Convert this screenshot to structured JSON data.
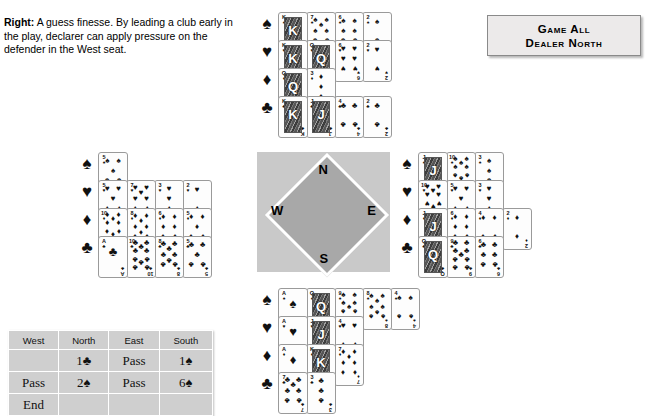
{
  "caption": {
    "lead": "Right:",
    "text": " A guess finesse. By leading a club early in the play, declarer can apply pressure on the defender in the West seat."
  },
  "vulnerability_box": {
    "line1": "Game All",
    "line2": "Dealer North"
  },
  "compass": {
    "north": "N",
    "south": "S",
    "west": "W",
    "east": "E"
  },
  "suits": {
    "spade": "♠",
    "heart": "♥",
    "diamond": "♦",
    "club": "♣"
  },
  "hands": {
    "north": {
      "label": "North",
      "spades": [
        "K",
        "7",
        "6",
        "2"
      ],
      "hearts": [
        "K",
        "Q",
        "6",
        "2"
      ],
      "diamonds": [
        "Q",
        "3"
      ],
      "clubs": [
        "K",
        "J",
        "4",
        "2"
      ]
    },
    "west": {
      "label": "West",
      "spades": [
        "5"
      ],
      "hearts": [
        "5",
        "7",
        "3",
        "2"
      ],
      "diamonds": [
        "10",
        "8",
        "6",
        "5"
      ],
      "clubs": [
        "A",
        "10",
        "8",
        "5"
      ]
    },
    "east": {
      "label": "East",
      "spades": [
        "J",
        "10",
        "3"
      ],
      "hearts": [
        "10",
        "5",
        "3"
      ],
      "diamonds": [
        "J",
        "6",
        "4",
        "2"
      ],
      "clubs": [
        "Q",
        "9",
        "6"
      ]
    },
    "south": {
      "label": "South",
      "spades": [
        "A",
        "Q",
        "9",
        "8",
        "4"
      ],
      "hearts": [
        "A",
        "J",
        "4"
      ],
      "diamonds": [
        "A",
        "K",
        "7"
      ],
      "clubs": [
        "7",
        "3"
      ]
    }
  },
  "bidding": {
    "headers": [
      "West",
      "North",
      "East",
      "South"
    ],
    "rows": [
      [
        "",
        "1♣",
        "Pass",
        "1♠"
      ],
      [
        "Pass",
        "2♠",
        "Pass",
        "6♠"
      ],
      [
        "End",
        "",
        "",
        ""
      ]
    ]
  }
}
